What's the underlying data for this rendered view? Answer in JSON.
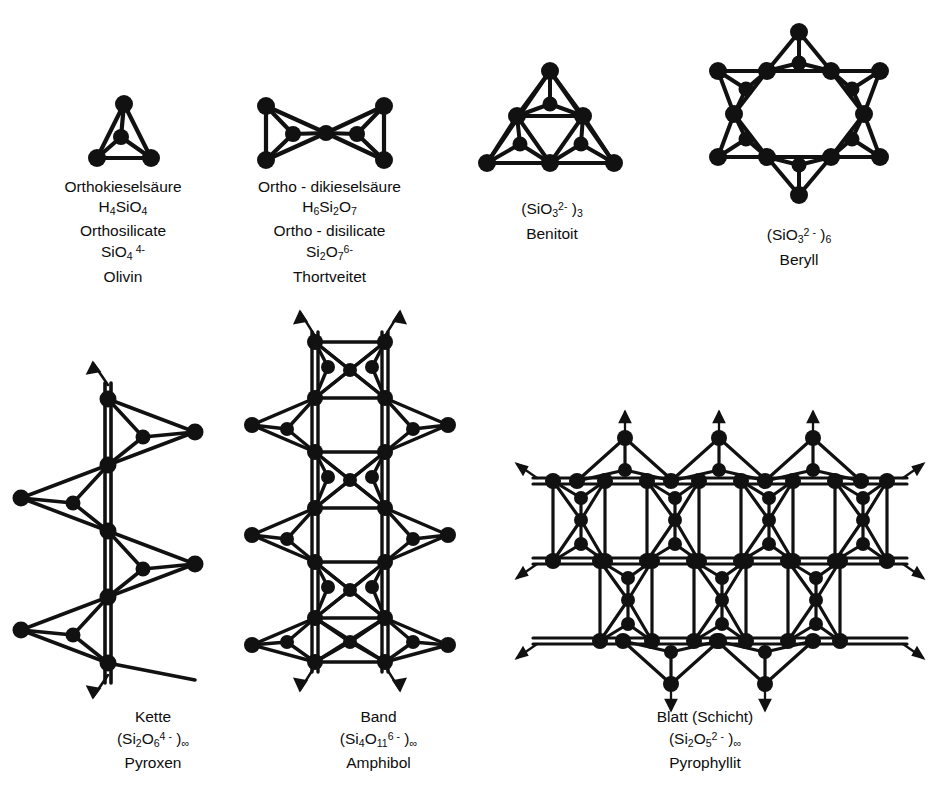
{
  "figure": {
    "background_color": "#ffffff",
    "ink_color": "#0d0d0d"
  },
  "structures": [
    {
      "id": "orthosilicate",
      "geometry": "single-tetrahedron",
      "tetrahedra_count": 1,
      "caption_lines": [
        "Orthokieselsäure",
        "H4SiO4",
        "Orthosilicate",
        "SiO4 4-",
        "Olivin"
      ],
      "german_name": "Orthokieselsäure",
      "acid_formula": "H4SiO4",
      "english_name": "Orthosilicate",
      "anion_formula": "SiO4 4-",
      "mineral": "Olivin"
    },
    {
      "id": "disilicate",
      "geometry": "two-tetrahedra-sharing-corner",
      "tetrahedra_count": 2,
      "caption_lines": [
        "Ortho - dikieselsäure",
        "H6Si2O7",
        "Ortho - disilicate",
        "Si2O7 6-",
        "Thortveitet"
      ],
      "german_name": "Ortho - dikieselsäure",
      "acid_formula": "H6Si2O7",
      "english_name": "Ortho - disilicate",
      "anion_formula": "Si2O7 6-",
      "mineral": "Thortveitet"
    },
    {
      "id": "three-ring",
      "geometry": "three-membered-ring",
      "tetrahedra_count": 3,
      "caption_lines": [
        "(SiO3 2-)3",
        "Benitoit"
      ],
      "anion_formula": "(SiO3 2-)3",
      "mineral": "Benitoit"
    },
    {
      "id": "six-ring",
      "geometry": "six-membered-ring",
      "tetrahedra_count": 6,
      "caption_lines": [
        "(SiO3 2-)6",
        "Beryll"
      ],
      "anion_formula": "(SiO3 2-)6",
      "mineral": "Beryll"
    },
    {
      "id": "chain",
      "geometry": "single-chain",
      "tetrahedra_count": 6,
      "caption_lines": [
        "Kette",
        "(Si2O6 4-)∞",
        "Pyroxen"
      ],
      "german_name": "Kette",
      "anion_formula": "(Si2O6 4-)∞",
      "mineral": "Pyroxen"
    },
    {
      "id": "band",
      "geometry": "double-chain",
      "caption_lines": [
        "Band",
        "(Si4O11 6-)∞",
        "Amphibol"
      ],
      "german_name": "Band",
      "anion_formula": "(Si4O11 6-)∞",
      "mineral": "Amphibol"
    },
    {
      "id": "sheet",
      "geometry": "hexagonal-sheet",
      "caption_lines": [
        "Blatt (Schicht)",
        "(Si2O5 2-)∞",
        "Pyrophyllit"
      ],
      "german_name": "Blatt (Schicht)",
      "anion_formula": "(Si2O5 2-)∞",
      "mineral": "Pyrophyllit"
    }
  ],
  "captions": {
    "orthosilicate": {
      "l1": "Orthokieselsäure",
      "l3": "Orthosilicate",
      "l5": "Olivin"
    },
    "disilicate": {
      "l1": "Ortho - dikieselsäure",
      "l3": "Ortho - disilicate",
      "l5": "Thortveitet"
    },
    "three_ring": {
      "mineral": "Benitoit"
    },
    "six_ring": {
      "mineral": "Beryll"
    },
    "chain": {
      "title": "Kette",
      "mineral": "Pyroxen"
    },
    "band": {
      "title": "Band",
      "mineral": "Amphibol"
    },
    "sheet": {
      "title": "Blatt (Schicht)",
      "mineral": "Pyrophyllit"
    }
  },
  "symbols": {
    "infinity": "∞",
    "minus": "-"
  }
}
